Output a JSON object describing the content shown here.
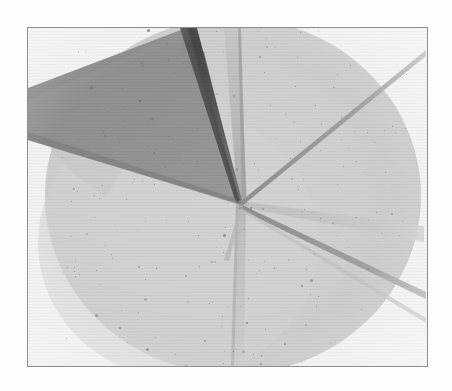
{
  "figure": {
    "kind": "scanned-grayscale-plate",
    "caption": "",
    "frame": {
      "border_color": "#8e8e8e",
      "border_width_px": 1,
      "x": 27,
      "y": 27,
      "width": 401,
      "height": 340
    },
    "page_background": "#fdfdfd",
    "plate_background": "#f3f3f3"
  },
  "palette": {
    "page": "#fdfdfd",
    "outside_disc": "#f1f1f1",
    "disc_fill": "#cdcdcd",
    "disc_fill_light": "#d6d6d6",
    "disc_edge": "#c2c2c2",
    "wedge_body": "#8d8d8d",
    "wedge_edge_dark": "#4a4a4a",
    "wedge_shadow": "#7c7c7c",
    "ray_gray": "#b4b4b4",
    "ray_dark": "#9a9a9a",
    "ray_faint": "#c6c6c6",
    "speckle": "#6d6d6d",
    "frame_border": "#8e8e8e"
  },
  "disc": {
    "label": "illuminated circular field",
    "center_x": 205,
    "center_y": 168,
    "radius_x": 188,
    "radius_y": 178
  },
  "convergence_point": {
    "label": "ray convergence point",
    "x": 213,
    "y": 175
  },
  "wedge": {
    "label": "dark tapered blade wedge",
    "body_color": "#8d8d8d",
    "edge_color": "#4a4a4a",
    "apex_x": 213,
    "apex_y": 175,
    "notes": "enters from upper-left corner, tapers to the convergence point"
  },
  "rays": [
    {
      "name": "ray-up-vertical-band",
      "direction": "up",
      "angle_deg": -86,
      "width_px": 13,
      "color": "#b9b9b9",
      "length_px": 180
    },
    {
      "name": "ray-upper-right-thin",
      "direction": "upper-right",
      "angle_deg": -42,
      "width_px": 3,
      "color": "#9e9e9e",
      "length_px": 230
    },
    {
      "name": "ray-lower-right-thin",
      "direction": "lower-right",
      "angle_deg": 21,
      "width_px": 3,
      "color": "#9c9c9c",
      "length_px": 230
    },
    {
      "name": "ray-down-vertical-band",
      "direction": "down",
      "angle_deg": 91,
      "width_px": 12,
      "color": "#c3c3c3",
      "length_px": 200
    },
    {
      "name": "ray-right-wide-pale",
      "direction": "right",
      "angle_deg": 9,
      "width_px": 20,
      "color": "#c6c6c6",
      "length_px": 200
    }
  ],
  "texture": {
    "speckle_count": 300,
    "speckle_color": "#6d6d6d",
    "scanlines": true,
    "scanline_spacing_px": 3
  },
  "accessibility": {
    "alt_text": "Grayscale scanned plate showing a bright circular field with several faint rays converging at a central point and a dark tapered blade entering from the upper left."
  }
}
